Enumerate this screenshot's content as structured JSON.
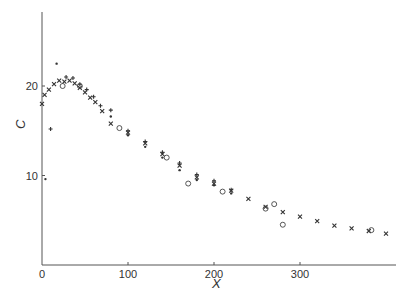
{
  "chart_data": {
    "type": "scatter",
    "title": "",
    "xlabel": "X",
    "ylabel": "C",
    "xlim": [
      0,
      410
    ],
    "ylim": [
      0,
      28
    ],
    "xticks": [
      0,
      100,
      200,
      300
    ],
    "yticks": [
      10,
      20
    ],
    "grid": false,
    "legend": "none",
    "series": [
      {
        "name": "crosses",
        "marker": "x",
        "points": [
          [
            0,
            18.0
          ],
          [
            3,
            19.0
          ],
          [
            8,
            19.6
          ],
          [
            14,
            20.2
          ],
          [
            20,
            20.6
          ],
          [
            26,
            20.5
          ],
          [
            32,
            20.6
          ],
          [
            38,
            20.3
          ],
          [
            44,
            19.8
          ],
          [
            50,
            19.3
          ],
          [
            56,
            18.7
          ],
          [
            62,
            18.2
          ],
          [
            70,
            17.2
          ],
          [
            80,
            15.8
          ],
          [
            100,
            14.8
          ],
          [
            120,
            13.6
          ],
          [
            140,
            12.4
          ],
          [
            160,
            11.1
          ],
          [
            180,
            9.8
          ],
          [
            200,
            9.1
          ],
          [
            220,
            8.3
          ],
          [
            240,
            7.4
          ],
          [
            260,
            6.5
          ],
          [
            280,
            5.9
          ],
          [
            300,
            5.4
          ],
          [
            320,
            4.9
          ],
          [
            340,
            4.4
          ],
          [
            360,
            4.1
          ],
          [
            380,
            3.8
          ],
          [
            400,
            3.5
          ]
        ]
      },
      {
        "name": "plus",
        "marker": "+",
        "points": [
          [
            10,
            15.2
          ],
          [
            28,
            21.0
          ],
          [
            36,
            20.9
          ],
          [
            44,
            20.2
          ],
          [
            52,
            19.6
          ],
          [
            60,
            18.8
          ],
          [
            68,
            17.8
          ],
          [
            80,
            17.3
          ],
          [
            100,
            15.0
          ],
          [
            120,
            13.8
          ],
          [
            140,
            12.6
          ],
          [
            160,
            11.4
          ],
          [
            180,
            10.1
          ],
          [
            200,
            9.4
          ],
          [
            220,
            8.4
          ]
        ]
      },
      {
        "name": "dots",
        "marker": "dot",
        "points": [
          [
            4,
            9.6
          ],
          [
            17,
            22.5
          ],
          [
            80,
            16.6
          ],
          [
            100,
            14.5
          ],
          [
            120,
            13.2
          ],
          [
            140,
            12.0
          ],
          [
            160,
            10.6
          ],
          [
            180,
            9.5
          ],
          [
            200,
            8.9
          ],
          [
            220,
            8.0
          ]
        ]
      },
      {
        "name": "circles",
        "marker": "o",
        "points": [
          [
            24,
            20.0
          ],
          [
            44,
            20.0
          ],
          [
            90,
            15.3
          ],
          [
            145,
            12.0
          ],
          [
            170,
            9.1
          ],
          [
            210,
            8.2
          ],
          [
            260,
            6.3
          ],
          [
            270,
            6.8
          ],
          [
            280,
            4.5
          ],
          [
            383,
            3.9
          ]
        ]
      }
    ]
  }
}
